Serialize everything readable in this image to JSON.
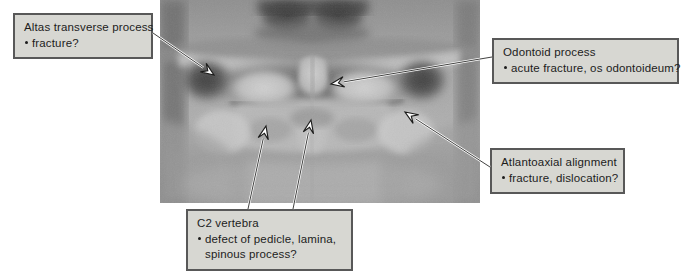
{
  "figure": {
    "kind": "annotated-radiograph",
    "modality": "open-mouth odontoid cervical spine radiograph",
    "box_fill": "#d7d7d2",
    "box_border": "#585858",
    "text_color": "#1c1c1c"
  },
  "image": {
    "label": "cervical-spine-open-mouth-odontoid-view",
    "x": 160,
    "y": 0,
    "width": 320,
    "height": 203
  },
  "callouts": [
    {
      "id": "atlas-transverse-process",
      "title": "Altas transverse process",
      "items": [
        "fracture?"
      ],
      "x": 13,
      "y": 13,
      "width": 140,
      "height": 45
    },
    {
      "id": "odontoid-process",
      "title": "Odontoid process",
      "items": [
        "acute fracture, os odontoideum?"
      ],
      "x": 492,
      "y": 38,
      "width": 187,
      "height": 45
    },
    {
      "id": "atlantoaxial-alignment",
      "title": "Atlantoaxial alignment",
      "items": [
        "fracture, dislocation?"
      ],
      "x": 490,
      "y": 148,
      "width": 135,
      "height": 41
    },
    {
      "id": "c2-vertebra",
      "title": "C2 vertebra",
      "items": [
        "defect of pedicle, lamina,",
        "spinous process?"
      ],
      "x": 186,
      "y": 209,
      "width": 167,
      "height": 58
    }
  ],
  "arrows": [
    {
      "id": "arrow-atlas-transverse-process",
      "from": [
        153,
        33
      ],
      "to": [
        214,
        75
      ]
    },
    {
      "id": "arrow-odontoid-process",
      "from": [
        492,
        57
      ],
      "to": [
        331,
        84
      ]
    },
    {
      "id": "arrow-atlantoaxial-alignment",
      "from": [
        490,
        167
      ],
      "to": [
        405,
        112
      ]
    },
    {
      "id": "arrow-c2-pedicle-lamina",
      "from": [
        248,
        209
      ],
      "to": [
        266,
        126
      ]
    },
    {
      "id": "arrow-c2-spinous-process",
      "from": [
        293,
        209
      ],
      "to": [
        311,
        120
      ]
    }
  ]
}
